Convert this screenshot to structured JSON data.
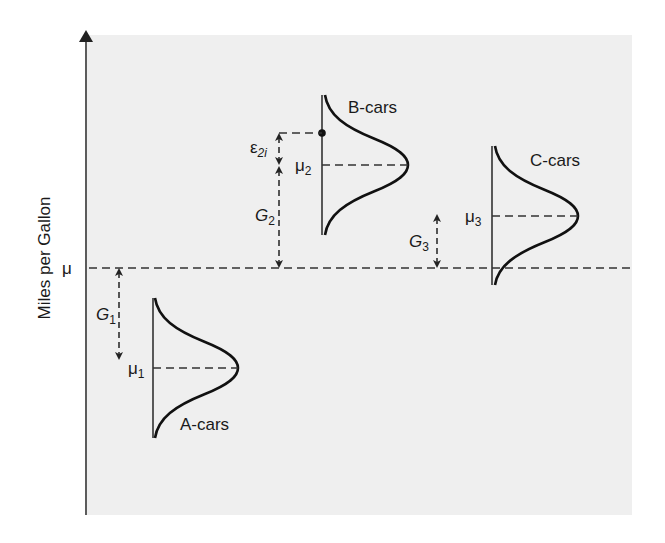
{
  "diagram": {
    "axis": {
      "label": "Miles per Gallon",
      "mean_label": "μ"
    },
    "groups": [
      {
        "id": "A",
        "label": "A-cars",
        "mean_symbol": "μ",
        "mean_sub": "1",
        "gap_symbol": "G",
        "gap_sub": "1",
        "direction": "below grand mean"
      },
      {
        "id": "B",
        "label": "B-cars",
        "mean_symbol": "μ",
        "mean_sub": "2",
        "gap_symbol": "G",
        "gap_sub": "2",
        "direction": "above grand mean"
      },
      {
        "id": "C",
        "label": "C-cars",
        "mean_symbol": "μ",
        "mean_sub": "3",
        "gap_symbol": "G",
        "gap_sub": "3",
        "direction": "above grand mean"
      }
    ],
    "error_term": {
      "symbol": "ε",
      "sub": "2i",
      "group": "B"
    }
  },
  "colors": {
    "panel": "#efefef",
    "ink": "#1a1a1a",
    "background": "#ffffff"
  }
}
